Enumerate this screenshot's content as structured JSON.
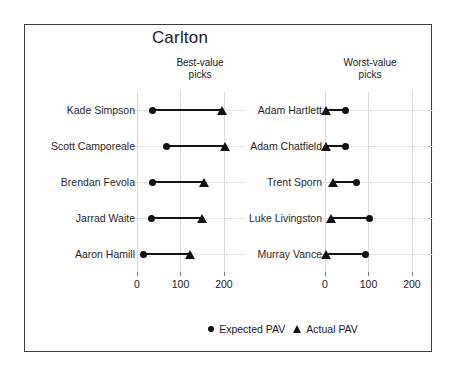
{
  "chart_data": {
    "type": "scatter",
    "title": "Carlton",
    "xlabel": "",
    "ylabel": "",
    "xlim": [
      0,
      230
    ],
    "xticks": [
      0,
      100,
      200
    ],
    "xticklabels": [
      "0",
      "100",
      "200"
    ],
    "grid": true,
    "legend_position": "bottom",
    "legend": [
      {
        "marker": "circle",
        "label": "Expected PAV"
      },
      {
        "marker": "triangle",
        "label": "Actual PAV"
      }
    ],
    "series_names": [
      "Expected PAV",
      "Actual PAV"
    ],
    "marker_color": "#111111",
    "panels": [
      {
        "heading_line1": "Best-value",
        "heading_line2": "picks",
        "rows": [
          {
            "label": "Kade Simpson",
            "expected_pav": 36,
            "actual_pav": 196
          },
          {
            "label": "Scott Camporeale",
            "expected_pav": 68,
            "actual_pav": 202
          },
          {
            "label": "Brendan Fevola",
            "expected_pav": 35,
            "actual_pav": 155
          },
          {
            "label": "Jarrad Waite",
            "expected_pav": 34,
            "actual_pav": 150
          },
          {
            "label": "Aaron Hamill",
            "expected_pav": 16,
            "actual_pav": 122
          }
        ]
      },
      {
        "heading_line1": "Worst-value",
        "heading_line2": "picks",
        "rows": [
          {
            "label": "Adam Hartlett",
            "expected_pav": 48,
            "actual_pav": 3
          },
          {
            "label": "Adam Chatfield",
            "expected_pav": 48,
            "actual_pav": 2
          },
          {
            "label": "Trent Sporn",
            "expected_pav": 73,
            "actual_pav": 18
          },
          {
            "label": "Luke Livingston",
            "expected_pav": 103,
            "actual_pav": 14
          },
          {
            "label": "Murray Vance",
            "expected_pav": 92,
            "actual_pav": 2
          }
        ]
      }
    ]
  }
}
